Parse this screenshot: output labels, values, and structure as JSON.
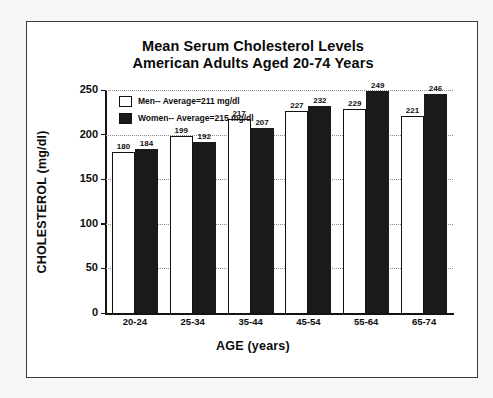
{
  "chart_data": {
    "type": "bar",
    "title": "Mean Serum Cholesterol Levels American Adults Aged 20-74 Years",
    "title_line1": "Mean Serum Cholesterol Levels",
    "title_line2": "American Adults Aged 20-74 Years",
    "xlabel": "AGE (years)",
    "ylabel": "CHOLESTEROL (mg/dl)",
    "ylim": [
      0,
      250
    ],
    "yticks": [
      250,
      200,
      150,
      100,
      50,
      0
    ],
    "ytick_labels": [
      "250",
      "200",
      "150",
      "100",
      "50",
      "0"
    ],
    "grid": true,
    "grid_style": "dotted-horizontal",
    "legend_position": "top-left-inside",
    "categories": [
      "20-24",
      "25-34",
      "35-44",
      "45-54",
      "55-64",
      "65-74"
    ],
    "series": [
      {
        "name": "Men-- Average=211 mg/dl",
        "short_name": "Men",
        "average": 211,
        "units": "mg/dl",
        "color": "#ffffff",
        "edge_color": "#111111",
        "values": [
          180,
          199,
          217,
          227,
          229,
          221
        ]
      },
      {
        "name": "Women-- Average=215 mg/dl",
        "short_name": "Women",
        "average": 215,
        "units": "mg/dl",
        "color": "#1a1a1a",
        "edge_color": "#1a1a1a",
        "values": [
          184,
          192,
          207,
          232,
          249,
          246
        ]
      }
    ]
  }
}
